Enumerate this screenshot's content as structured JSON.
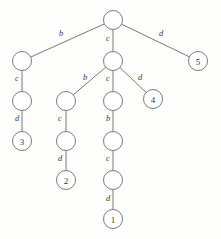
{
  "figure": {
    "background_color": "#fdfdfc",
    "stroke_color": "#6b6b6b",
    "text_color": "#3a3a3a",
    "width": 221,
    "height": 239
  },
  "nodes": [
    {
      "id": "root",
      "label": "",
      "cx": 113,
      "cy": 20,
      "r": 9.5,
      "is_leaf": false
    },
    {
      "id": "n_b1",
      "label": "",
      "cx": 22,
      "cy": 61,
      "r": 9.5,
      "is_leaf": false
    },
    {
      "id": "n_c1",
      "label": "",
      "cx": 113,
      "cy": 61,
      "r": 9.5,
      "is_leaf": false
    },
    {
      "id": "leaf5",
      "label": "5",
      "cx": 198,
      "cy": 61,
      "r": 9.5,
      "is_leaf": true
    },
    {
      "id": "n_b1c",
      "label": "",
      "cx": 22,
      "cy": 101,
      "r": 9.5,
      "is_leaf": false
    },
    {
      "id": "n_cb",
      "label": "",
      "cx": 66,
      "cy": 101,
      "r": 9.5,
      "is_leaf": false
    },
    {
      "id": "n_cc",
      "label": "",
      "cx": 113,
      "cy": 101,
      "r": 9.5,
      "is_leaf": false
    },
    {
      "id": "leaf4",
      "label": "4",
      "cx": 153,
      "cy": 99,
      "r": 9.5,
      "is_leaf": true
    },
    {
      "id": "leaf3",
      "label": "3",
      "cx": 22,
      "cy": 141,
      "r": 9.5,
      "is_leaf": true
    },
    {
      "id": "n_cbc",
      "label": "",
      "cx": 66,
      "cy": 141,
      "r": 9.5,
      "is_leaf": false
    },
    {
      "id": "n_ccb",
      "label": "",
      "cx": 113,
      "cy": 141,
      "r": 9.5,
      "is_leaf": false
    },
    {
      "id": "leaf2",
      "label": "2",
      "cx": 66,
      "cy": 180,
      "r": 9.5,
      "is_leaf": true
    },
    {
      "id": "n_ccbc",
      "label": "",
      "cx": 113,
      "cy": 180,
      "r": 9.5,
      "is_leaf": false
    },
    {
      "id": "leaf1",
      "label": "1",
      "cx": 113,
      "cy": 219,
      "r": 9.5,
      "is_leaf": true
    }
  ],
  "edges": [
    {
      "from": "root",
      "to": "n_b1",
      "label": "b",
      "lx": 61,
      "ly": 33
    },
    {
      "from": "root",
      "to": "n_c1",
      "label": "c",
      "lx": 108,
      "ly": 38
    },
    {
      "from": "root",
      "to": "leaf5",
      "label": "d",
      "lx": 161,
      "ly": 33
    },
    {
      "from": "n_b1",
      "to": "n_b1c",
      "label": "c",
      "lx": 17,
      "ly": 78
    },
    {
      "from": "n_c1",
      "to": "n_cb",
      "label": "b",
      "lx": 85,
      "ly": 77
    },
    {
      "from": "n_c1",
      "to": "n_cc",
      "label": "c",
      "lx": 108,
      "ly": 78
    },
    {
      "from": "n_c1",
      "to": "leaf4",
      "label": "d",
      "lx": 140,
      "ly": 77
    },
    {
      "from": "n_b1c",
      "to": "leaf3",
      "label": "d",
      "lx": 17,
      "ly": 118
    },
    {
      "from": "n_cb",
      "to": "n_cbc",
      "label": "c",
      "lx": 60,
      "ly": 118
    },
    {
      "from": "n_cc",
      "to": "n_ccb",
      "label": "b",
      "lx": 108,
      "ly": 118
    },
    {
      "from": "n_cbc",
      "to": "leaf2",
      "label": "d",
      "lx": 60,
      "ly": 158
    },
    {
      "from": "n_ccb",
      "to": "n_ccbc",
      "label": "c",
      "lx": 108,
      "ly": 158
    },
    {
      "from": "n_ccbc",
      "to": "leaf1",
      "label": "d",
      "lx": 108,
      "ly": 198
    }
  ]
}
